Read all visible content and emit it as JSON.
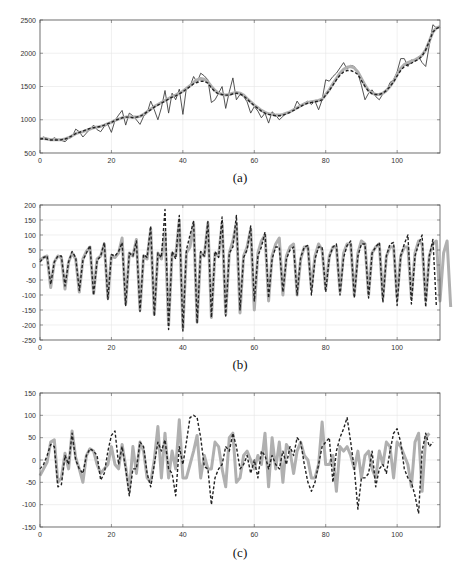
{
  "colors": {
    "axis": "#555555",
    "grid": "#e6e6e6",
    "observed": "#404040",
    "fitted_gray": "#b0b0b0",
    "dashed": "#222222"
  },
  "chart_data": [
    {
      "id": "a",
      "type": "line",
      "caption": "(a)",
      "xlabel": "",
      "ylabel": "",
      "xlim": [
        0,
        112
      ],
      "ylim": [
        500,
        2500
      ],
      "xticks": [
        0,
        20,
        40,
        60,
        80,
        100
      ],
      "yticks": [
        500,
        1000,
        1500,
        2000,
        2500
      ],
      "grid": true,
      "legend": null,
      "series": [
        {
          "name": "observed",
          "style": "solid-thin",
          "values": [
            720,
            740,
            720,
            690,
            730,
            700,
            690,
            670,
            720,
            740,
            860,
            820,
            740,
            800,
            860,
            920,
            850,
            820,
            900,
            930,
            810,
            990,
            1070,
            1140,
            920,
            1100,
            1060,
            1000,
            930,
            1050,
            1100,
            1280,
            1150,
            1000,
            1180,
            1440,
            1100,
            1400,
            1300,
            1460,
            1080,
            1480,
            1500,
            1650,
            1560,
            1700,
            1660,
            1600,
            1260,
            1300,
            1400,
            1500,
            1170,
            1420,
            1630,
            1300,
            1380,
            1350,
            1270,
            1100,
            1200,
            1130,
            1030,
            1100,
            950,
            1120,
            1070,
            1000,
            1050,
            1100,
            1120,
            1150,
            1280,
            1200,
            1250,
            1280,
            1230,
            1280,
            1150,
            1300,
            1600,
            1580,
            1650,
            1700,
            1780,
            1860,
            1760,
            1820,
            1800,
            1700,
            1520,
            1300,
            1400,
            1450,
            1350,
            1300,
            1390,
            1420,
            1560,
            1600,
            1720,
            1920,
            1920,
            1800,
            1900,
            1880,
            1950,
            1860,
            1800,
            2120,
            2430,
            2380,
            2400
          ]
        },
        {
          "name": "smoothed",
          "style": "thick-gray",
          "values": [
            720,
            720,
            710,
            700,
            700,
            700,
            700,
            710,
            730,
            760,
            790,
            810,
            820,
            840,
            860,
            880,
            890,
            900,
            920,
            940,
            960,
            990,
            1010,
            1030,
            1040,
            1040,
            1040,
            1040,
            1050,
            1080,
            1120,
            1160,
            1200,
            1230,
            1260,
            1290,
            1320,
            1350,
            1370,
            1400,
            1430,
            1470,
            1510,
            1560,
            1600,
            1620,
            1610,
            1570,
            1500,
            1440,
            1400,
            1380,
            1370,
            1380,
            1400,
            1410,
            1400,
            1370,
            1320,
            1270,
            1220,
            1180,
            1140,
            1110,
            1090,
            1080,
            1070,
            1070,
            1080,
            1100,
            1120,
            1150,
            1180,
            1210,
            1240,
            1260,
            1270,
            1280,
            1290,
            1310,
            1380,
            1450,
            1540,
            1620,
            1700,
            1760,
            1790,
            1800,
            1780,
            1720,
            1620,
            1520,
            1440,
            1400,
            1380,
            1380,
            1400,
            1440,
            1500,
            1580,
            1680,
            1770,
            1830,
            1860,
            1880,
            1900,
            1930,
            1970,
            2050,
            2180,
            2320,
            2380,
            2400
          ]
        },
        {
          "name": "predicted",
          "style": "dashed",
          "values": [
            710,
            715,
            705,
            695,
            695,
            695,
            700,
            710,
            730,
            760,
            790,
            810,
            830,
            850,
            870,
            880,
            890,
            900,
            920,
            940,
            960,
            990,
            1010,
            1030,
            1040,
            1040,
            1030,
            1040,
            1050,
            1080,
            1120,
            1150,
            1190,
            1220,
            1250,
            1280,
            1310,
            1340,
            1360,
            1390,
            1420,
            1460,
            1500,
            1540,
            1560,
            1580,
            1580,
            1550,
            1480,
            1420,
            1390,
            1380,
            1370,
            1370,
            1390,
            1400,
            1390,
            1360,
            1310,
            1260,
            1210,
            1170,
            1130,
            1100,
            1080,
            1070,
            1060,
            1060,
            1070,
            1090,
            1110,
            1140,
            1170,
            1200,
            1230,
            1250,
            1260,
            1270,
            1280,
            1300,
            1370,
            1440,
            1520,
            1600,
            1670,
            1720,
            1740,
            1740,
            1720,
            1680,
            1590,
            1500,
            1430,
            1390,
            1380,
            1380,
            1400,
            1440,
            1500,
            1570,
            1660,
            1740,
            1800,
            1830,
            1850,
            1880,
            1910,
            1960,
            2050,
            2180,
            2320,
            2370,
            2400
          ]
        }
      ]
    },
    {
      "id": "b",
      "type": "line",
      "caption": "(b)",
      "xlabel": "",
      "ylabel": "",
      "xlim": [
        0,
        112
      ],
      "ylim": [
        -250,
        200
      ],
      "xticks": [
        0,
        20,
        40,
        60,
        80,
        100
      ],
      "yticks": [
        -250,
        -200,
        -150,
        -100,
        -50,
        0,
        50,
        100,
        150,
        200
      ],
      "grid": true,
      "legend": null,
      "series": [
        {
          "name": "cyclical-component",
          "style": "thick-gray",
          "values": [
            15,
            25,
            30,
            -75,
            10,
            30,
            25,
            -80,
            10,
            40,
            20,
            -90,
            20,
            45,
            60,
            -95,
            20,
            30,
            70,
            -110,
            30,
            25,
            40,
            90,
            -130,
            40,
            30,
            85,
            -150,
            30,
            20,
            120,
            -165,
            40,
            20,
            110,
            -200,
            40,
            30,
            150,
            -210,
            40,
            60,
            140,
            -190,
            40,
            30,
            140,
            -175,
            40,
            30,
            140,
            -165,
            40,
            80,
            140,
            -160,
            30,
            60,
            120,
            -150,
            40,
            80,
            100,
            -120,
            30,
            70,
            90,
            -100,
            30,
            60,
            70,
            -100,
            20,
            60,
            60,
            -80,
            30,
            70,
            50,
            -80,
            30,
            60,
            60,
            -90,
            40,
            70,
            70,
            -100,
            40,
            80,
            70,
            -100,
            40,
            60,
            70,
            -110,
            30,
            60,
            60,
            -110,
            30,
            60,
            60,
            -110,
            40,
            80,
            70,
            -120,
            30,
            70,
            80,
            -120,
            40,
            80,
            -140
          ]
        },
        {
          "name": "predicted",
          "style": "dashed",
          "values": [
            10,
            25,
            30,
            -65,
            10,
            30,
            30,
            -70,
            10,
            45,
            25,
            -85,
            15,
            40,
            65,
            -100,
            15,
            30,
            75,
            -115,
            35,
            30,
            45,
            75,
            -135,
            40,
            30,
            80,
            -155,
            35,
            25,
            130,
            -170,
            40,
            25,
            185,
            -215,
            45,
            20,
            165,
            -220,
            50,
            100,
            145,
            -195,
            45,
            30,
            145,
            -175,
            45,
            25,
            160,
            -170,
            40,
            60,
            165,
            -150,
            25,
            50,
            130,
            -120,
            30,
            60,
            110,
            -110,
            20,
            60,
            60,
            -90,
            20,
            50,
            60,
            -100,
            25,
            60,
            65,
            -100,
            20,
            60,
            60,
            -90,
            25,
            60,
            70,
            -100,
            25,
            65,
            80,
            -110,
            30,
            70,
            70,
            -110,
            40,
            60,
            75,
            -125,
            30,
            70,
            75,
            -135,
            30,
            70,
            100,
            -130,
            30,
            70,
            100,
            -140,
            30,
            85,
            -140
          ]
        }
      ]
    },
    {
      "id": "c",
      "type": "line",
      "caption": "(c)",
      "xlabel": "",
      "ylabel": "",
      "xlim": [
        0,
        112
      ],
      "ylim": [
        -150,
        150
      ],
      "xticks": [
        0,
        20,
        40,
        60,
        80,
        100
      ],
      "yticks": [
        -150,
        -100,
        -50,
        0,
        50,
        100,
        150
      ],
      "grid": true,
      "legend": null,
      "series": [
        {
          "name": "irregular-component",
          "style": "thick-gray",
          "values": [
            -35,
            -20,
            -5,
            40,
            45,
            -50,
            -40,
            15,
            -20,
            65,
            5,
            -20,
            -50,
            10,
            25,
            20,
            -10,
            -30,
            -20,
            -10,
            30,
            -10,
            -20,
            35,
            -15,
            -70,
            30,
            -30,
            40,
            20,
            -40,
            -50,
            0,
            75,
            -40,
            60,
            -40,
            20,
            -20,
            90,
            -40,
            -40,
            -10,
            20,
            55,
            -40,
            10,
            -20,
            -20,
            40,
            30,
            -20,
            -60,
            50,
            60,
            -50,
            -40,
            10,
            20,
            0,
            -20,
            10,
            -10,
            60,
            -60,
            50,
            -20,
            40,
            -50,
            35,
            20,
            -30,
            20,
            40,
            10,
            0,
            -40,
            -40,
            -10,
            85,
            -10,
            -10,
            10,
            -70,
            30,
            20,
            30,
            10,
            -20,
            20,
            -40,
            10,
            20,
            -20,
            -40,
            20,
            -10,
            40,
            30,
            -40,
            40,
            30,
            10,
            -10,
            -60,
            40,
            60,
            -70,
            50,
            60
          ]
        },
        {
          "name": "predicted",
          "style": "dashed",
          "values": [
            -20,
            -10,
            10,
            35,
            30,
            -60,
            -55,
            10,
            -10,
            60,
            0,
            -20,
            -30,
            10,
            25,
            20,
            10,
            -45,
            -30,
            20,
            55,
            65,
            -10,
            30,
            -20,
            -80,
            -20,
            -20,
            40,
            30,
            -30,
            -60,
            -10,
            40,
            20,
            45,
            -20,
            -30,
            -80,
            30,
            -10,
            40,
            95,
            100,
            95,
            50,
            -15,
            -20,
            -100,
            -40,
            -20,
            -10,
            30,
            20,
            60,
            30,
            -20,
            -10,
            10,
            -30,
            0,
            -40,
            20,
            10,
            -20,
            10,
            -10,
            -20,
            20,
            -10,
            30,
            10,
            50,
            40,
            -10,
            -50,
            -70,
            -50,
            -10,
            30,
            40,
            50,
            -50,
            20,
            50,
            70,
            95,
            40,
            -20,
            -110,
            -40,
            -40,
            -30,
            20,
            -60,
            -20,
            -10,
            -30,
            20,
            60,
            70,
            40,
            -20,
            -40,
            -50,
            -80,
            -120,
            20,
            60,
            30,
            40
          ]
        }
      ]
    }
  ],
  "layout": [
    {
      "plot": {
        "x": 40,
        "y": 20,
        "w": 400,
        "h": 133
      },
      "caption_y": 182
    },
    {
      "plot": {
        "x": 40,
        "y": 205,
        "w": 400,
        "h": 135
      },
      "caption_y": 369
    },
    {
      "plot": {
        "x": 40,
        "y": 393,
        "w": 400,
        "h": 134
      },
      "caption_y": 557
    }
  ]
}
